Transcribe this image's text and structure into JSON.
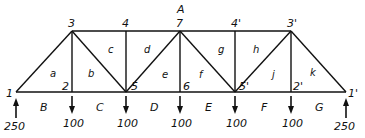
{
  "diagram": {
    "type": "truss",
    "nodes": [
      {
        "id": "1",
        "label": "1",
        "x": 16,
        "y": 92,
        "lx": 6,
        "ly": 97
      },
      {
        "id": "2",
        "label": "2",
        "x": 72,
        "y": 92,
        "lx": 62,
        "ly": 90
      },
      {
        "id": "5",
        "label": "5",
        "x": 126,
        "y": 92,
        "lx": 131,
        "ly": 90
      },
      {
        "id": "6",
        "label": "6",
        "x": 180,
        "y": 92,
        "lx": 183,
        "ly": 90
      },
      {
        "id": "5p",
        "label": "5'",
        "x": 235,
        "y": 92,
        "lx": 239,
        "ly": 90
      },
      {
        "id": "2p",
        "label": "2'",
        "x": 291,
        "y": 92,
        "lx": 293,
        "ly": 90
      },
      {
        "id": "1p",
        "label": "1'",
        "x": 346,
        "y": 92,
        "lx": 348,
        "ly": 97
      },
      {
        "id": "3",
        "label": "3",
        "x": 72,
        "y": 31,
        "lx": 68,
        "ly": 27
      },
      {
        "id": "4",
        "label": "4",
        "x": 126,
        "y": 31,
        "lx": 122,
        "ly": 27
      },
      {
        "id": "7",
        "label": "7",
        "x": 180,
        "y": 31,
        "lx": 176,
        "ly": 27
      },
      {
        "id": "4p",
        "label": "4'",
        "x": 235,
        "y": 31,
        "lx": 231,
        "ly": 27
      },
      {
        "id": "3p",
        "label": "3'",
        "x": 291,
        "y": 31,
        "lx": 287,
        "ly": 27
      }
    ],
    "members": [
      [
        "1",
        "2"
      ],
      [
        "2",
        "5"
      ],
      [
        "5",
        "6"
      ],
      [
        "6",
        "5p"
      ],
      [
        "5p",
        "2p"
      ],
      [
        "2p",
        "1p"
      ],
      [
        "3",
        "4"
      ],
      [
        "4",
        "7"
      ],
      [
        "7",
        "4p"
      ],
      [
        "4p",
        "3p"
      ],
      [
        "1",
        "3"
      ],
      [
        "3",
        "2"
      ],
      [
        "3",
        "5"
      ],
      [
        "4",
        "5"
      ],
      [
        "5",
        "7"
      ],
      [
        "7",
        "6"
      ],
      [
        "7",
        "5p"
      ],
      [
        "4p",
        "5p"
      ],
      [
        "5p",
        "3p"
      ],
      [
        "3p",
        "2p"
      ],
      [
        "3p",
        "1p"
      ]
    ],
    "top_label": {
      "text": "A",
      "x": 177,
      "y": 13
    },
    "panel_labels": [
      {
        "text": "a",
        "x": 50,
        "y": 77
      },
      {
        "text": "b",
        "x": 88,
        "y": 77
      },
      {
        "text": "c",
        "x": 108,
        "y": 53
      },
      {
        "text": "d",
        "x": 144,
        "y": 53
      },
      {
        "text": "e",
        "x": 162,
        "y": 78
      },
      {
        "text": "f",
        "x": 199,
        "y": 78
      },
      {
        "text": "g",
        "x": 218,
        "y": 53
      },
      {
        "text": "h",
        "x": 253,
        "y": 53
      },
      {
        "text": "j",
        "x": 272,
        "y": 78
      },
      {
        "text": "k",
        "x": 310,
        "y": 76
      }
    ],
    "space_labels": [
      {
        "text": "B",
        "x": 40,
        "y": 111
      },
      {
        "text": "C",
        "x": 96,
        "y": 111
      },
      {
        "text": "D",
        "x": 150,
        "y": 111
      },
      {
        "text": "E",
        "x": 205,
        "y": 111
      },
      {
        "text": "F",
        "x": 261,
        "y": 111
      },
      {
        "text": "G",
        "x": 315,
        "y": 111
      }
    ],
    "loads": [
      {
        "label": "250",
        "x": 16,
        "direction": "up",
        "lx": 4,
        "ly": 130
      },
      {
        "label": "100",
        "x": 72,
        "direction": "down",
        "lx": 63,
        "ly": 127
      },
      {
        "label": "100",
        "x": 126,
        "direction": "down",
        "lx": 117,
        "ly": 127
      },
      {
        "label": "100",
        "x": 180,
        "direction": "down",
        "lx": 171,
        "ly": 127
      },
      {
        "label": "100",
        "x": 235,
        "direction": "down",
        "lx": 226,
        "ly": 127
      },
      {
        "label": "100",
        "x": 291,
        "direction": "down",
        "lx": 282,
        "ly": 127
      },
      {
        "label": "250",
        "x": 346,
        "direction": "up",
        "lx": 334,
        "ly": 130
      }
    ]
  }
}
